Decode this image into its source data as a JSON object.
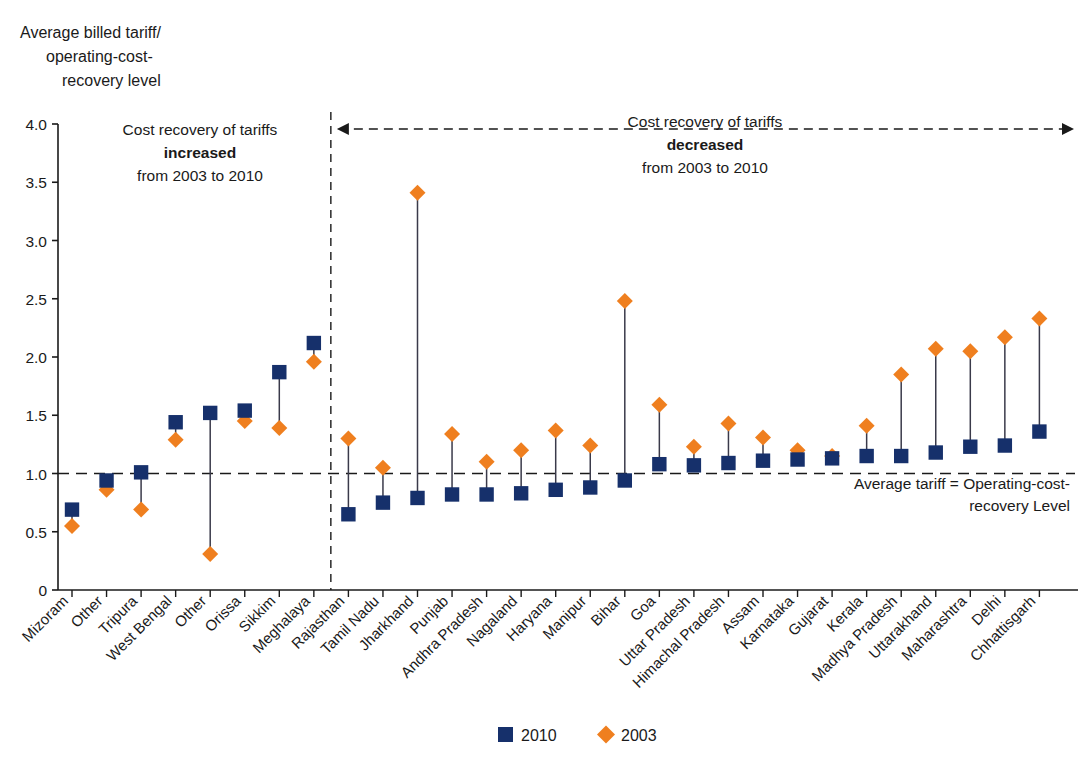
{
  "chart_data": {
    "type": "scatter",
    "title": "",
    "ylabel": "Average billed tariff/\noperating-cost-\nrecovery level",
    "ylabel_lines": [
      "Average billed tariff/",
      "operating-cost-",
      "recovery level"
    ],
    "xlabel": "",
    "ylim": [
      0,
      4.0
    ],
    "yticks": [
      0,
      0.5,
      1.0,
      1.5,
      2.0,
      2.5,
      3.0,
      3.5,
      4.0
    ],
    "ytick_labels": [
      "0",
      "0.5",
      "1.0",
      "1.5",
      "2.0",
      "2.5",
      "3.0",
      "3.5",
      "4.0"
    ],
    "grid": false,
    "legend_position": "bottom",
    "reference_line": {
      "value": 1.0,
      "label_lines": [
        "Average tariff = Operating-cost-",
        "recovery Level"
      ]
    },
    "annotations": [
      {
        "id": "left-group",
        "lines": [
          "Cost recovery of tariffs",
          "increased",
          "from 2003 to 2010"
        ],
        "bold_line_index": 1
      },
      {
        "id": "right-group",
        "lines": [
          "Cost recovery of tariffs",
          "decreased",
          "from 2003 to 2010"
        ],
        "bold_line_index": 1
      }
    ],
    "series": [
      {
        "name": "2010",
        "marker": "square",
        "color": "#16306b"
      },
      {
        "name": "2003",
        "marker": "diamond",
        "color": "#ef7f1f"
      }
    ],
    "categories": [
      "Mizoram",
      "Other",
      "Tripura",
      "West Bengal",
      "Other",
      "Orissa",
      "Sikkim",
      "Meghalaya",
      "Rajasthan",
      "Tamil Nadu",
      "Jharkhand",
      "Punjab",
      "Andhra Pradesh",
      "Nagaland",
      "Haryana",
      "Manipur",
      "Bihar",
      "Goa",
      "Uttar Pradesh",
      "Himachal Pradesh",
      "Assam",
      "Karnataka",
      "Gujarat",
      "Kerala",
      "Madhya Pradesh",
      "Uttarakhand",
      "Maharashtra",
      "Delhi",
      "Chhattisgarh"
    ],
    "values_2010": [
      0.69,
      0.94,
      1.01,
      1.44,
      1.52,
      1.54,
      1.87,
      2.12,
      0.65,
      0.75,
      0.79,
      0.82,
      0.82,
      0.83,
      0.86,
      0.88,
      0.94,
      1.08,
      1.07,
      1.09,
      1.11,
      1.12,
      1.13,
      1.15,
      1.15,
      1.18,
      1.23,
      1.24,
      1.36
    ],
    "values_2003": [
      0.55,
      0.86,
      0.69,
      1.29,
      0.31,
      1.45,
      1.39,
      1.96,
      1.3,
      1.05,
      3.41,
      1.34,
      1.1,
      1.2,
      1.37,
      1.24,
      2.48,
      1.59,
      1.23,
      1.43,
      1.31,
      1.2,
      1.15,
      1.41,
      1.85,
      2.07,
      2.05,
      2.17,
      2.33
    ],
    "split_after_index": 7
  },
  "legend": {
    "items": [
      {
        "label": "2010",
        "color": "#16306b",
        "marker": "square"
      },
      {
        "label": "2003",
        "color": "#ef7f1f",
        "marker": "diamond"
      }
    ]
  },
  "colors": {
    "series_2010": "#16306b",
    "series_2003": "#ef7f1f",
    "axis": "#1a1a1a",
    "background": "#ffffff"
  }
}
